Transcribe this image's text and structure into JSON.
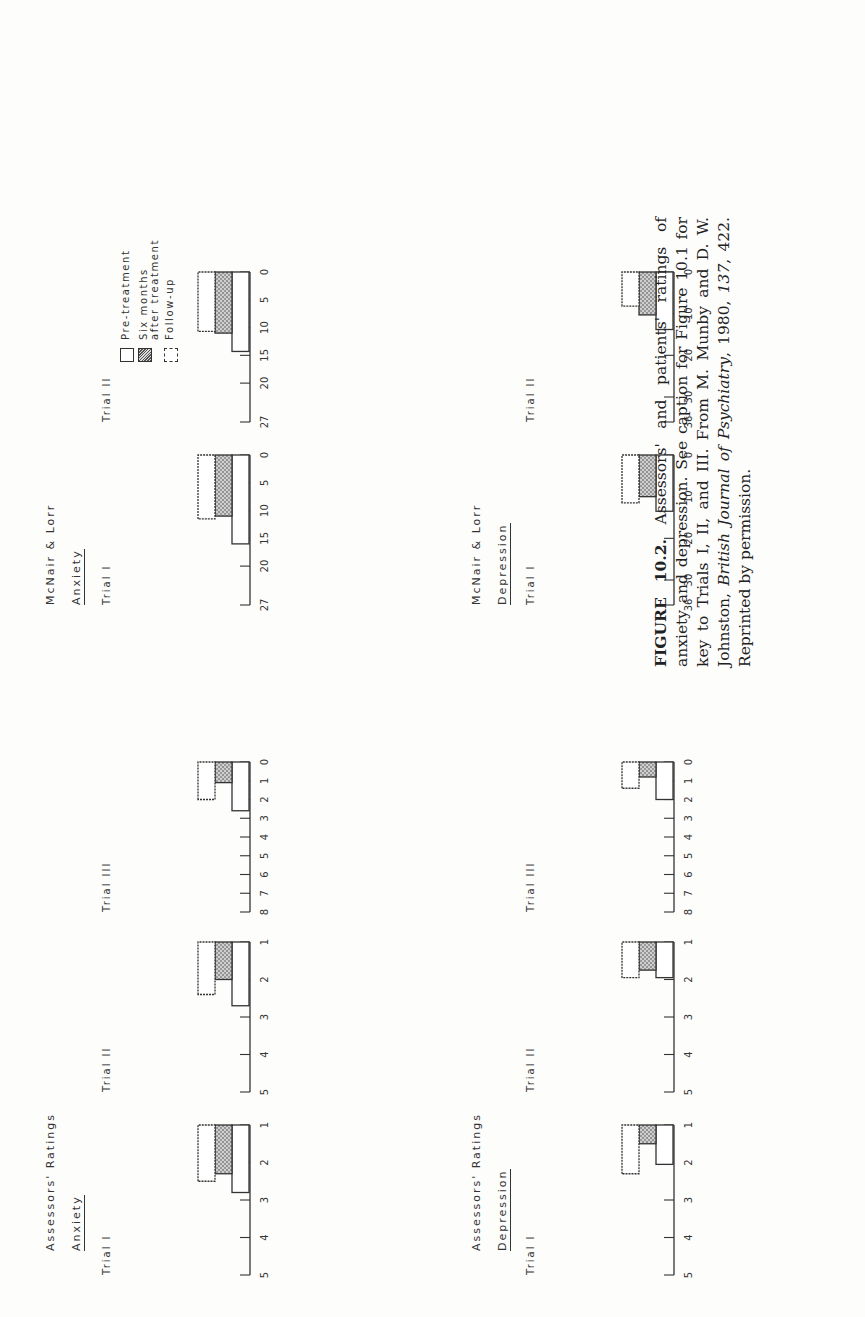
{
  "figure": {
    "groups": {
      "assessors_anxiety": {
        "title": "Assessors' Ratings",
        "subtitle": "Anxiety"
      },
      "mcnair_anxiety": {
        "title": "McNair & Lorr",
        "subtitle": "Anxiety"
      },
      "assessors_depression": {
        "title": "Assessors' Ratings",
        "subtitle": "Depression"
      },
      "mcnair_depression": {
        "title": "McNair & Lorr",
        "subtitle": "Depression"
      }
    },
    "legend": [
      {
        "label": "Pre-treatment",
        "style": "open"
      },
      {
        "label": "Six months",
        "label2": "after treatment",
        "style": "stippled"
      },
      {
        "label": "Follow-up",
        "style": "open-dashed"
      }
    ],
    "caption": {
      "label": "FIGURE 10.2.",
      "text": "Assessors' and patients' ratings of anxiety and depression. See caption for Figure 10.1 for key to Trials I, II, and III. From M. Munby and D. W. Johnston,",
      "journal": "British Journal of Psychiatry",
      "year": "1980,",
      "volume": "137",
      "rest": ", 422. Reprinted by permission."
    }
  },
  "chart_data": [
    {
      "type": "bar",
      "group": "Assessors' Ratings — Anxiety",
      "title": "Trial I",
      "axis_min": 1,
      "axis_max": 5,
      "ticks": [
        1,
        2,
        3,
        4,
        5
      ],
      "categories": [
        "Pre-treatment",
        "Six months after treatment",
        "Follow-up"
      ],
      "values": [
        2.8,
        2.3,
        2.5
      ]
    },
    {
      "type": "bar",
      "group": "Assessors' Ratings — Anxiety",
      "title": "Trial II",
      "axis_min": 1,
      "axis_max": 5,
      "ticks": [
        1,
        2,
        3,
        4,
        5
      ],
      "categories": [
        "Pre-treatment",
        "Six months after treatment",
        "Follow-up"
      ],
      "values": [
        2.7,
        2.0,
        2.4
      ]
    },
    {
      "type": "bar",
      "group": "Assessors' Ratings — Anxiety",
      "title": "Trial III",
      "axis_min": 0,
      "axis_max": 8,
      "ticks": [
        0,
        1,
        2,
        3,
        4,
        5,
        6,
        7,
        8
      ],
      "categories": [
        "Pre-treatment",
        "Six months after treatment",
        "Follow-up"
      ],
      "values": [
        2.6,
        1.1,
        2.0
      ]
    },
    {
      "type": "bar",
      "group": "McNair & Lorr — Anxiety",
      "title": "Trial I",
      "axis_min": 0,
      "axis_max": 27,
      "ticks": [
        0,
        5,
        10,
        15,
        20,
        27
      ],
      "categories": [
        "Pre-treatment",
        "Six months after treatment",
        "Follow-up"
      ],
      "values": [
        16,
        11,
        11.5
      ]
    },
    {
      "type": "bar",
      "group": "McNair & Lorr — Anxiety",
      "title": "Trial II",
      "axis_min": 0,
      "axis_max": 27,
      "ticks": [
        0,
        5,
        10,
        15,
        20,
        27
      ],
      "categories": [
        "Pre-treatment",
        "Six months after treatment",
        "Follow-up"
      ],
      "values": [
        14.3,
        11,
        10.7
      ]
    },
    {
      "type": "bar",
      "group": "Assessors' Ratings — Depression",
      "title": "Trial I",
      "axis_min": 1,
      "axis_max": 5,
      "ticks": [
        1,
        2,
        3,
        4,
        5
      ],
      "categories": [
        "Pre-treatment",
        "Six months after treatment",
        "Follow-up"
      ],
      "values": [
        2.05,
        1.5,
        2.3
      ]
    },
    {
      "type": "bar",
      "group": "Assessors' Ratings — Depression",
      "title": "Trial II",
      "axis_min": 1,
      "axis_max": 5,
      "ticks": [
        1,
        2,
        3,
        4,
        5
      ],
      "categories": [
        "Pre-treatment",
        "Six months after treatment",
        "Follow-up"
      ],
      "values": [
        1.95,
        1.75,
        1.95
      ]
    },
    {
      "type": "bar",
      "group": "Assessors' Ratings — Depression",
      "title": "Trial III",
      "axis_min": 0,
      "axis_max": 8,
      "ticks": [
        0,
        1,
        2,
        3,
        4,
        5,
        6,
        7,
        8
      ],
      "categories": [
        "Pre-treatment",
        "Six months after treatment",
        "Follow-up"
      ],
      "values": [
        2.0,
        0.8,
        1.4
      ]
    },
    {
      "type": "bar",
      "group": "McNair & Lorr — Depression",
      "title": "Trial I",
      "axis_min": 0,
      "axis_max": 36,
      "ticks": [
        0,
        10,
        20,
        30,
        36
      ],
      "categories": [
        "Pre-treatment",
        "Six months after treatment",
        "Follow-up"
      ],
      "values": [
        13.5,
        10,
        11.5
      ]
    },
    {
      "type": "bar",
      "group": "McNair & Lorr — Depression",
      "title": "Trial II",
      "axis_min": 0,
      "axis_max": 36,
      "ticks": [
        0,
        10,
        20,
        30,
        36
      ],
      "categories": [
        "Pre-treatment",
        "Six months after treatment",
        "Follow-up"
      ],
      "values": [
        13.8,
        10.3,
        8.2
      ]
    }
  ]
}
